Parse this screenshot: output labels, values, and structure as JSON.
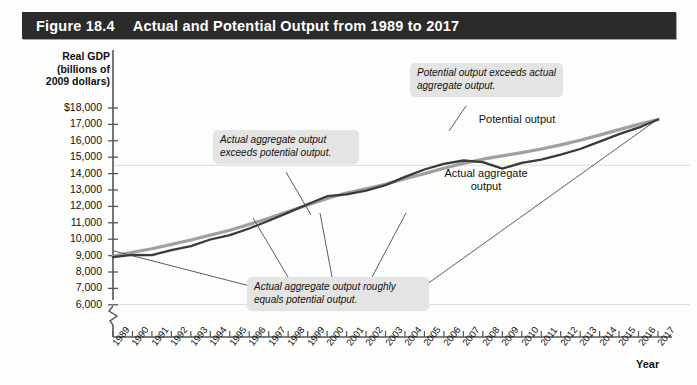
{
  "figure": {
    "number": "Figure 18.4",
    "title": "Actual and Potential Output from 1989 to 2017"
  },
  "axes": {
    "y_title": "Real GDP (billions of 2009 dollars)",
    "y_title_line1": "Real GDP",
    "y_title_line2": "(billions of",
    "y_title_line3": "2009 dollars)",
    "x_title": "Year",
    "y_ticks": [
      "$18,000",
      "17,000",
      "16,000",
      "15,000",
      "14,000",
      "13,000",
      "12,000",
      "11,000",
      "10,000",
      "9,000",
      "8,000",
      "7,000",
      "6,000"
    ],
    "axis_break": "zigzag-break"
  },
  "annotations": [
    {
      "id": "actual-exceeds",
      "text": "Actual aggregate output exceeds potential output."
    },
    {
      "id": "potential-exceeds",
      "text": "Potential output exceeds actual aggregate output."
    },
    {
      "id": "roughly-equals",
      "text": "Actual aggregate output roughly equals potential output."
    }
  ],
  "series_labels": {
    "potential": "Potential output",
    "actual": "Actual aggregate output"
  },
  "colors": {
    "title_bar": "#2b2b2b",
    "title_text": "#ffffff",
    "potential_line": "#a0a0a0",
    "actual_line": "#3a3a3a",
    "axis": "#555555",
    "gridline": "#dcdcdc",
    "callout_bg": "#e4e4e4",
    "tick_band": "#ededed"
  },
  "chart_data": {
    "type": "line",
    "title": "Actual and Potential Output from 1989 to 2017",
    "xlabel": "Year",
    "ylabel": "Real GDP (billions of 2009 dollars)",
    "xlim": [
      1989,
      2017
    ],
    "ylim": [
      6000,
      18000
    ],
    "grid": true,
    "legend": "inline-labels",
    "x": [
      1989,
      1990,
      1991,
      1992,
      1993,
      1994,
      1995,
      1996,
      1997,
      1998,
      1999,
      2000,
      2001,
      2002,
      2003,
      2004,
      2005,
      2006,
      2007,
      2008,
      2009,
      2010,
      2011,
      2012,
      2013,
      2014,
      2015,
      2016,
      2017
    ],
    "series": [
      {
        "name": "Potential output",
        "color": "#a0a0a0",
        "values": [
          8950,
          9200,
          9420,
          9680,
          9950,
          10250,
          10550,
          10900,
          11280,
          11680,
          12080,
          12480,
          12820,
          13080,
          13350,
          13680,
          14000,
          14330,
          14620,
          14880,
          15080,
          15280,
          15500,
          15750,
          16030,
          16350,
          16680,
          17000,
          17300
        ]
      },
      {
        "name": "Actual aggregate output",
        "color": "#3a3a3a",
        "values": [
          8900,
          9050,
          9030,
          9330,
          9580,
          9980,
          10250,
          10650,
          11120,
          11620,
          12130,
          12620,
          12740,
          12960,
          13300,
          13800,
          14250,
          14600,
          14800,
          14700,
          14300,
          14650,
          14850,
          15150,
          15500,
          15950,
          16400,
          16800,
          17300
        ]
      }
    ],
    "annotations": [
      {
        "text": "Actual aggregate output exceeds potential output.",
        "points_to": [
          2000
        ]
      },
      {
        "text": "Potential output exceeds actual aggregate output.",
        "points_to": [
          2009
        ]
      },
      {
        "text": "Actual aggregate output roughly equals potential output.",
        "points_to": [
          1989,
          1995,
          2003,
          2017
        ]
      }
    ]
  }
}
